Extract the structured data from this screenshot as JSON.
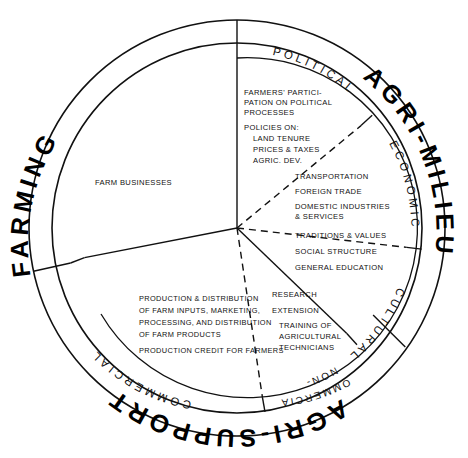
{
  "diagram": {
    "center": {
      "x": 237,
      "y": 228
    },
    "rings": {
      "outer_radius": 208,
      "band_inner_radius": 185,
      "sub_band_inner_radius": 170,
      "content_radius": 170
    },
    "outer_bands": [
      {
        "id": "farming",
        "label": "FARMING",
        "start_deg": 168,
        "end_deg": 272
      },
      {
        "id": "agri-milieu",
        "label": "AGRI-MILIEU",
        "start_deg": 272,
        "end_deg": 36
      },
      {
        "id": "agri-support",
        "label": "AGRI-SUPPORT",
        "start_deg": 36,
        "end_deg": 168
      }
    ],
    "inner_bands": [
      {
        "id": "political",
        "label": "POLITICAL",
        "parent": "agri-milieu"
      },
      {
        "id": "economic",
        "label": "ECONOMIC",
        "parent": "agri-milieu"
      },
      {
        "id": "cultural",
        "label": "CULTURAL",
        "parent": "agri-milieu"
      },
      {
        "id": "non-commercial",
        "label_line1": "NON-",
        "label_line2": "COMMERCIAL",
        "parent": "agri-support"
      },
      {
        "id": "commercial",
        "label": "COMMERCIAL",
        "parent": "agri-support"
      }
    ],
    "sectors": [
      {
        "id": "farming",
        "name": "Farming sector",
        "items": [
          "FARM BUSINESSES"
        ]
      },
      {
        "id": "political",
        "name": "Political sub-sector",
        "items": [
          "FARMERS' PARTICI-",
          "PATION ON POLITICAL",
          "PROCESSES",
          "POLICIES ON:",
          "LAND TENURE",
          "PRICES & TAXES",
          "AGRIC. DEV."
        ]
      },
      {
        "id": "economic",
        "name": "Economic sub-sector",
        "items": [
          "TRANSPORTATION",
          "FOREIGN TRADE",
          "DOMESTIC INDUSTRIES",
          "& SERVICES"
        ]
      },
      {
        "id": "cultural",
        "name": "Cultural sub-sector",
        "items": [
          "TRADITIONS & VALUES",
          "SOCIAL STRUCTURE",
          "GENERAL EDUCATION"
        ]
      },
      {
        "id": "non-commercial",
        "name": "Non-commercial agri-support",
        "items": [
          "RESEARCH",
          "EXTENSION",
          "TRAINING OF",
          "AGRICULTURAL",
          "TECHNICIANS"
        ]
      },
      {
        "id": "commercial",
        "name": "Commercial agri-support",
        "items": [
          "PRODUCTION & DISTRIBUTION",
          "OF FARM INPUTS, MARKETING,",
          "PROCESSING, AND DISTRIBUTION",
          "OF FARM PRODUCTS",
          "PRODUCTION CREDIT FOR FARMERS"
        ]
      }
    ],
    "colors": {
      "stroke": "#111111",
      "background": "#ffffff",
      "text": "#111111"
    }
  }
}
